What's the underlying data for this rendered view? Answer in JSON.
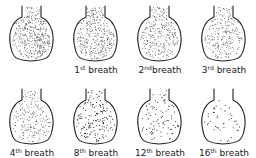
{
  "figure": {
    "ink_color": "#222222",
    "background": "#ffffff",
    "flasks": [
      {
        "row": 0,
        "col": 0,
        "label_num": "",
        "label_sup": "",
        "label_word": "",
        "dot_density": 1.0
      },
      {
        "row": 0,
        "col": 1,
        "label_num": "1",
        "label_sup": "st",
        "label_word": " breath",
        "dot_density": 0.85
      },
      {
        "row": 0,
        "col": 2,
        "label_num": "2",
        "label_sup": "nd",
        "label_word": "breath",
        "dot_density": 0.7
      },
      {
        "row": 0,
        "col": 3,
        "label_num": "3",
        "label_sup": "rd",
        "label_word": " breath",
        "dot_density": 0.6
      },
      {
        "row": 1,
        "col": 0,
        "label_num": "4",
        "label_sup": "th",
        "label_word": " breath",
        "dot_density": 0.5
      },
      {
        "row": 1,
        "col": 1,
        "label_num": "8",
        "label_sup": "th",
        "label_word": " breath",
        "dot_density": 0.35
      },
      {
        "row": 1,
        "col": 2,
        "label_num": "12",
        "label_sup": "th",
        "label_word": " breath",
        "dot_density": 0.2
      },
      {
        "row": 1,
        "col": 3,
        "label_num": "16",
        "label_sup": "th",
        "label_word": " breath",
        "dot_density": 0.1
      }
    ]
  }
}
